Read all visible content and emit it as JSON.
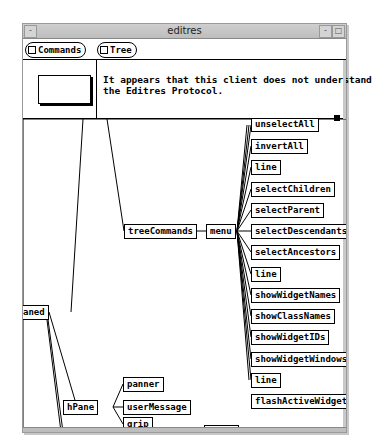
{
  "window": {
    "title": "editres",
    "titlebar_buttons": {
      "menu": "-",
      "minimize": "-",
      "maximize": "□"
    }
  },
  "menubar": {
    "commands_label": "Commands",
    "tree_label": "Tree"
  },
  "message": {
    "text": "It appears that this client does not understand\nthe Editres Protocol."
  },
  "tree": {
    "partial_left_node": "aned",
    "treeCommands": "treeCommands",
    "menu": "menu",
    "menu_items": [
      "unselectAll",
      "invertAll",
      "line",
      "selectChildren",
      "selectParent",
      "selectDescendants",
      "selectAncestors",
      "line",
      "showWidgetNames",
      "showClassNames",
      "showWidgetIDs",
      "showWidgetWindows",
      "line",
      "flashActiveWidgets"
    ],
    "hPane": "hPane",
    "hPane_children": [
      "panner",
      "userMessage",
      "grip"
    ],
    "partial_bottom_node": "porth"
  }
}
